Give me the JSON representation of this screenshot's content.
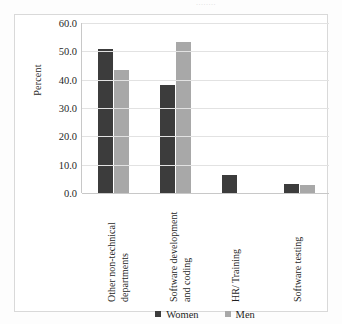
{
  "figure": {
    "top_fragment_text": "........",
    "background_color": "#fdfdfd",
    "frame_color": "#d9d9d9"
  },
  "legend": {
    "position": "bottom-center",
    "items": [
      {
        "label": "Women",
        "color": "#3c3c3c"
      },
      {
        "label": "Men",
        "color": "#a8a8a8"
      }
    ]
  },
  "axis": {
    "y_title": "Percent",
    "y_ticks": [
      "0.0",
      "10.0",
      "20.0",
      "30.0",
      "40.0",
      "50.0",
      "60.0"
    ]
  },
  "chart_data": {
    "type": "bar",
    "title": "",
    "xlabel": "",
    "ylabel": "Percent",
    "ylim": [
      0,
      60
    ],
    "ytick_step": 10,
    "grid": true,
    "legend_position": "bottom-center",
    "categories": [
      "Other non-technical departments",
      "Software development and coding",
      "HR/ Training",
      "Software testing"
    ],
    "series": [
      {
        "name": "Women",
        "color": "#3c3c3c",
        "values": [
          51.0,
          38.0,
          6.5,
          3.3
        ]
      },
      {
        "name": "Men",
        "color": "#a8a8a8",
        "values": [
          43.3,
          53.3,
          0.0,
          2.8
        ]
      }
    ]
  }
}
